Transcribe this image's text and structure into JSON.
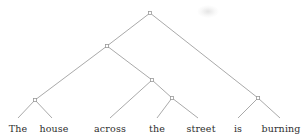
{
  "figure": {
    "kind": "syntax-parse-tree",
    "sentence": "The house across the street is burning",
    "width": 304,
    "height": 138,
    "background_color": "#ffffff",
    "line_color": "#9a9a9a",
    "text_color": "#2e2e2e",
    "node_marker": "open-square"
  },
  "nodes": [
    {
      "id": "root",
      "name": "root-node",
      "x": 150,
      "y": 13
    },
    {
      "id": "np-subj",
      "name": "subject-np-node",
      "x": 107,
      "y": 46
    },
    {
      "id": "nominal",
      "name": "determiner-noun-node",
      "x": 35,
      "y": 100
    },
    {
      "id": "pp",
      "name": "prepositional-phrase-node",
      "x": 152,
      "y": 80
    },
    {
      "id": "np-obj",
      "name": "object-np-node",
      "x": 172,
      "y": 98
    },
    {
      "id": "vp",
      "name": "verb-phrase-node",
      "x": 258,
      "y": 98
    }
  ],
  "edges": [
    {
      "name": "edge-root-to-subject-np",
      "x1": 150,
      "y1": 13,
      "x2": 107,
      "y2": 46
    },
    {
      "name": "edge-root-to-verb-phrase",
      "x1": 150,
      "y1": 13,
      "x2": 258,
      "y2": 98
    },
    {
      "name": "edge-subject-np-to-nominal",
      "x1": 107,
      "y1": 46,
      "x2": 35,
      "y2": 100
    },
    {
      "name": "edge-subject-np-to-pp",
      "x1": 107,
      "y1": 46,
      "x2": 152,
      "y2": 80
    },
    {
      "name": "edge-nominal-to-the",
      "x1": 35,
      "y1": 100,
      "x2": 18,
      "y2": 118
    },
    {
      "name": "edge-nominal-to-house",
      "x1": 35,
      "y1": 100,
      "x2": 52,
      "y2": 118
    },
    {
      "name": "edge-pp-to-across",
      "x1": 152,
      "y1": 80,
      "x2": 110,
      "y2": 118
    },
    {
      "name": "edge-pp-to-object-np",
      "x1": 152,
      "y1": 80,
      "x2": 172,
      "y2": 98
    },
    {
      "name": "edge-object-np-to-the",
      "x1": 172,
      "y1": 98,
      "x2": 157,
      "y2": 118
    },
    {
      "name": "edge-object-np-to-street",
      "x1": 172,
      "y1": 98,
      "x2": 198,
      "y2": 118
    },
    {
      "name": "edge-vp-to-is",
      "x1": 258,
      "y1": 98,
      "x2": 238,
      "y2": 118
    },
    {
      "name": "edge-vp-to-burning",
      "x1": 258,
      "y1": 98,
      "x2": 280,
      "y2": 118
    }
  ],
  "leaves": [
    {
      "id": "w1",
      "name": "leaf-word-the-1",
      "text": "The",
      "x": 18,
      "y": 123
    },
    {
      "id": "w2",
      "name": "leaf-word-house",
      "text": "house",
      "x": 54,
      "y": 123
    },
    {
      "id": "w3",
      "name": "leaf-word-across",
      "text": "across",
      "x": 110,
      "y": 123
    },
    {
      "id": "w4",
      "name": "leaf-word-the-2",
      "text": "the",
      "x": 157,
      "y": 123
    },
    {
      "id": "w5",
      "name": "leaf-word-street",
      "text": "street",
      "x": 201,
      "y": 123
    },
    {
      "id": "w6",
      "name": "leaf-word-is",
      "text": "is",
      "x": 238,
      "y": 123
    },
    {
      "id": "w7",
      "name": "leaf-word-burning",
      "text": "burning",
      "x": 281,
      "y": 123
    }
  ],
  "artifacts": [
    {
      "name": "page-smudge",
      "x": 197,
      "y": 5,
      "width": 22,
      "height": 13
    }
  ]
}
